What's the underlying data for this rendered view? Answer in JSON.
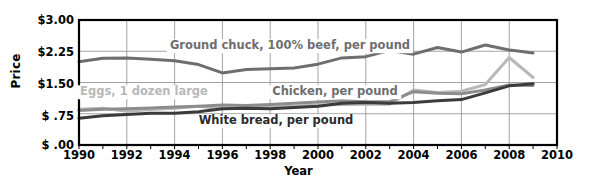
{
  "chart_data": {
    "type": "line",
    "title": "",
    "xlabel": "Year",
    "ylabel": "Price",
    "xlim": [
      1990,
      2010
    ],
    "ylim": [
      0,
      3.0
    ],
    "grid": true,
    "legend_position": "inline-annotations",
    "x_ticks": [
      "1990",
      "1992",
      "1994",
      "1996",
      "1998",
      "2000",
      "2002",
      "2004",
      "2006",
      "2008",
      "2010"
    ],
    "y_ticks": [
      "$ .00",
      "$ .75",
      "$1.50",
      "$2.25",
      "$3.00"
    ],
    "y_tick_values": [
      0,
      0.75,
      1.5,
      2.25,
      3.0
    ],
    "x": [
      1990,
      1991,
      1992,
      1993,
      1994,
      1995,
      1996,
      1997,
      1998,
      1999,
      2000,
      2001,
      2002,
      2003,
      2004,
      2005,
      2006,
      2007,
      2008,
      2009
    ],
    "series": [
      {
        "name": "Ground chuck, 100% beef, per pound",
        "color": "#6e6e6e",
        "values": [
          2.0,
          2.08,
          2.09,
          2.06,
          2.02,
          1.93,
          1.73,
          1.81,
          1.83,
          1.85,
          1.94,
          2.09,
          2.12,
          2.27,
          2.18,
          2.34,
          2.23,
          2.4,
          2.28,
          2.21
        ]
      },
      {
        "name": "Eggs, 1 dozen large",
        "color": "#b8b8b8",
        "values": [
          0.86,
          0.88,
          0.81,
          0.85,
          0.88,
          0.93,
          0.87,
          0.9,
          0.91,
          0.93,
          0.96,
          0.97,
          0.98,
          0.98,
          1.32,
          1.26,
          1.29,
          1.45,
          2.1,
          1.62
        ]
      },
      {
        "name": "Chicken, per pound",
        "color": "#8c8c8c",
        "values": [
          0.83,
          0.86,
          0.87,
          0.89,
          0.91,
          0.93,
          0.96,
          0.95,
          0.97,
          1.0,
          1.03,
          1.06,
          1.04,
          1.04,
          1.28,
          1.24,
          1.23,
          1.32,
          1.44,
          1.43
        ]
      },
      {
        "name": "White bread, per pound",
        "color": "#3b3b3b",
        "values": [
          0.64,
          0.7,
          0.73,
          0.76,
          0.76,
          0.8,
          0.87,
          0.88,
          0.87,
          0.9,
          0.93,
          1.0,
          1.02,
          1.0,
          1.02,
          1.06,
          1.09,
          1.25,
          1.42,
          1.47
        ]
      }
    ],
    "annotations": [
      {
        "text": "Ground chuck, 100% beef, per pound",
        "color": "#6e6e6e"
      },
      {
        "text": "Eggs, 1 dozen large",
        "color": "#b8b8b8"
      },
      {
        "text": "Chicken, per pound",
        "color": "#6e6e6e"
      },
      {
        "text": "White bread, per pound",
        "color": "#2b2b2b"
      }
    ]
  }
}
